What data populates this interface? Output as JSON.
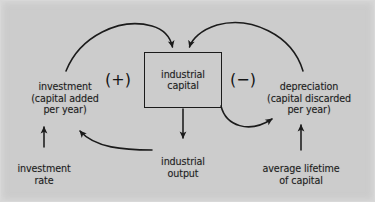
{
  "figure": {
    "kind": "causal-loop-diagram",
    "background_color": "#cccccc",
    "ink_color": "#1b1b1b",
    "width": 375,
    "height": 202
  },
  "nodes": {
    "stock": {
      "id": "industrial-capital",
      "label": "industrial\ncapital",
      "shape": "rectangle"
    },
    "inflow": {
      "id": "investment",
      "label": "investment\n(capital added\nper year)"
    },
    "outflow": {
      "id": "depreciation",
      "label": "depreciation\n(capital discarded\nper year)"
    },
    "output": {
      "id": "industrial-output",
      "label": "industrial\noutput"
    },
    "investment_rate": {
      "id": "investment-rate",
      "label": "investment\nrate"
    },
    "lifetime": {
      "id": "average-lifetime-of-capital",
      "label": "average lifetime\nof capital"
    }
  },
  "polarity": {
    "positive": {
      "id": "positive-feedback-marker",
      "label": "(+)"
    },
    "negative": {
      "id": "negative-feedback-marker",
      "label": "(−)"
    }
  },
  "links": [
    {
      "id": "investment-to-capital",
      "from": "investment",
      "to": "industrial-capital",
      "style": "arc",
      "arrow": "to"
    },
    {
      "id": "depreciation-to-capital",
      "from": "depreciation",
      "to": "industrial-capital",
      "style": "arc",
      "arrow": "to"
    },
    {
      "id": "capital-to-output",
      "from": "industrial-capital",
      "to": "industrial-output",
      "style": "straight",
      "arrow": "to"
    },
    {
      "id": "capital-to-depreciation",
      "from": "industrial-capital",
      "to": "depreciation",
      "style": "arc",
      "arrow": "to"
    },
    {
      "id": "output-to-investment",
      "from": "industrial-output",
      "to": "investment",
      "style": "arc",
      "arrow": "to"
    },
    {
      "id": "investment-rate-to-investment",
      "from": "investment-rate",
      "to": "investment",
      "style": "straight",
      "arrow": "to"
    },
    {
      "id": "lifetime-to-depreciation",
      "from": "average-lifetime-of-capital",
      "to": "depreciation",
      "style": "straight",
      "arrow": "to"
    }
  ]
}
